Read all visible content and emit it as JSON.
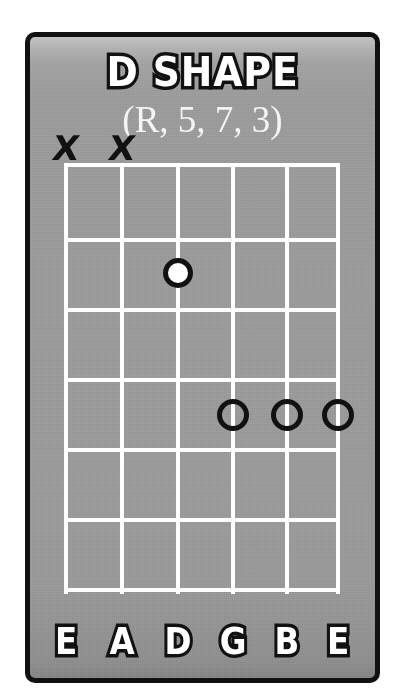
{
  "card": {
    "title": "D SHAPE",
    "intervals": "(R, 5, 7, 3)",
    "background_color": "#9a9a9a",
    "border_color": "#111111",
    "line_color": "#ffffff",
    "text_color": "#ffffff"
  },
  "fretboard": {
    "string_count": 6,
    "fret_count": 6,
    "string_names": [
      "E",
      "A",
      "D",
      "G",
      "B",
      "E"
    ],
    "string_x": [
      36,
      92,
      148,
      203,
      257,
      308
    ],
    "fret_y": [
      128,
      203,
      273,
      343,
      413,
      483,
      553
    ],
    "muted_strings": [
      {
        "string_index": 0,
        "symbol": "X",
        "x": 36,
        "y": 126
      },
      {
        "string_index": 1,
        "symbol": "X",
        "x": 92,
        "y": 126
      }
    ],
    "markers": [
      {
        "string_index": 2,
        "string_name": "D",
        "fret": 2,
        "type": "root",
        "degree": "R",
        "x": 148,
        "y": 236
      },
      {
        "string_index": 3,
        "string_name": "G",
        "fret": 4,
        "type": "tone",
        "degree": "5",
        "x": 203,
        "y": 378
      },
      {
        "string_index": 4,
        "string_name": "B",
        "fret": 4,
        "type": "tone",
        "degree": "7",
        "x": 257,
        "y": 378
      },
      {
        "string_index": 5,
        "string_name": "E",
        "fret": 4,
        "type": "tone",
        "degree": "3",
        "x": 308,
        "y": 378
      }
    ],
    "label_y": 583
  }
}
